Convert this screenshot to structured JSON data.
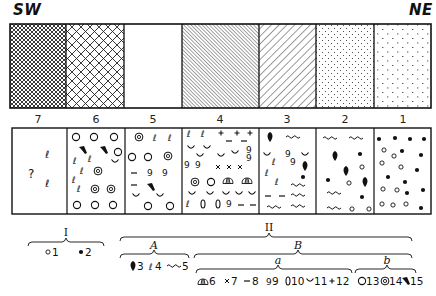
{
  "diagram": {
    "type": "geological facies cross-section with fossil assemblage legend",
    "direction_left": "SW",
    "direction_right": "NE",
    "top_panel": {
      "columns": [
        {
          "index": 7,
          "pattern": "fine cross-hatch"
        },
        {
          "index": 6,
          "pattern": "coarse cross-hatch"
        },
        {
          "index": 5,
          "pattern": "blank"
        },
        {
          "index": 4,
          "pattern": "dense fine diagonal hatch"
        },
        {
          "index": 3,
          "pattern": "diagonal lines"
        },
        {
          "index": 2,
          "pattern": "fine dots"
        },
        {
          "index": 1,
          "pattern": "sparse dashes/dots"
        }
      ]
    },
    "column_labels": [
      "7",
      "6",
      "5",
      "4",
      "3",
      "2",
      "1"
    ],
    "bottom_panel": {
      "columns": [
        {
          "index": 7,
          "symbols": [
            "?",
            "4",
            "4"
          ]
        },
        {
          "index": 6,
          "symbols": [
            "13",
            "15",
            "4",
            "11",
            "14"
          ]
        },
        {
          "index": 5,
          "symbols": [
            "14",
            "4",
            "13",
            "8",
            "9",
            "15",
            "11"
          ]
        },
        {
          "index": 4,
          "symbols": [
            "4",
            "12",
            "8",
            "11",
            "9",
            "7",
            "14",
            "13",
            "6",
            "10"
          ]
        },
        {
          "index": 3,
          "symbols": [
            "3",
            "5",
            "11",
            "9",
            "4",
            "2",
            "8"
          ]
        },
        {
          "index": 2,
          "symbols": [
            "5",
            "3",
            "2",
            "1"
          ]
        },
        {
          "index": 1,
          "symbols": [
            "2",
            "1"
          ]
        }
      ]
    },
    "legend": {
      "group_I": {
        "label": "I",
        "items": [
          {
            "symbol": "small-open-circle",
            "num": "1"
          },
          {
            "symbol": "filled-dot",
            "num": "2"
          }
        ]
      },
      "group_II": {
        "label": "II",
        "subgroup_A": {
          "label": "A",
          "items": [
            {
              "symbol": "filled-drop",
              "num": "3"
            },
            {
              "symbol": "curl-e",
              "num": "4"
            },
            {
              "symbol": "wave",
              "num": "5"
            }
          ]
        },
        "subgroup_B": {
          "label": "B",
          "part_a": {
            "label": "a",
            "items": [
              {
                "symbol": "dome",
                "num": "6"
              },
              {
                "symbol": "cross-x",
                "num": "7"
              },
              {
                "symbol": "dash",
                "num": "8"
              },
              {
                "symbol": "curl-9",
                "num": "9"
              },
              {
                "symbol": "oval",
                "num": "10"
              },
              {
                "symbol": "cup",
                "num": "11"
              },
              {
                "symbol": "plus",
                "num": "12"
              }
            ]
          },
          "part_b": {
            "label": "b",
            "items": [
              {
                "symbol": "open-circle",
                "num": "13"
              },
              {
                "symbol": "double-circle",
                "num": "14"
              },
              {
                "symbol": "filled-claw",
                "num": "15"
              }
            ]
          }
        }
      }
    },
    "legend_text": {
      "I": "I",
      "II": "II",
      "A": "A",
      "B": "B",
      "a": "a",
      "b": "b",
      "n1": "1",
      "n2": "2",
      "n3": "3",
      "n4": "4",
      "n5": "5",
      "n6": "6",
      "n7": "7",
      "n8": "8",
      "n9": "9",
      "n10": "10",
      "n11": "11",
      "n12": "12",
      "n13": "13",
      "n14": "14",
      "n15": "15"
    },
    "colors": {
      "ink": "#111111",
      "background": "#ffffff"
    }
  }
}
